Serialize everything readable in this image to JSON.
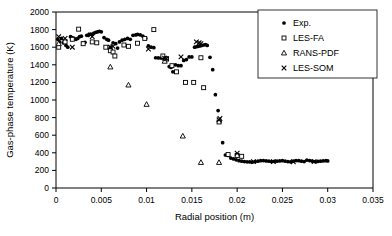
{
  "chart_data": {
    "type": "scatter",
    "title": "",
    "xlabel": "Radial position (m)",
    "ylabel": "Gas-phase temperature (K)",
    "xlim": [
      0,
      0.035
    ],
    "ylim": [
      0,
      2000
    ],
    "xticks": [
      0,
      0.005,
      0.01,
      0.015,
      0.02,
      0.025,
      0.03,
      0.035
    ],
    "xtick_labels": [
      "0",
      "0.005",
      "0.01",
      "0.015",
      "0.02",
      "0.025",
      "0.03",
      "0.035"
    ],
    "yticks": [
      0,
      200,
      400,
      600,
      800,
      1000,
      1200,
      1400,
      1600,
      1800,
      2000
    ],
    "ytick_labels": [
      "0",
      "200",
      "400",
      "600",
      "800",
      "1000",
      "1200",
      "1400",
      "1600",
      "1800",
      "2000"
    ],
    "grid": false,
    "legend_position": "top-right",
    "series": [
      {
        "name": "Exp.",
        "marker": "filled-circle",
        "color": "#000000",
        "points": [
          [
            0.0002,
            1690
          ],
          [
            0.0004,
            1660
          ],
          [
            0.0006,
            1700
          ],
          [
            0.0008,
            1650
          ],
          [
            0.0011,
            1620
          ],
          [
            0.0013,
            1600
          ],
          [
            0.0016,
            1720
          ],
          [
            0.0018,
            1710
          ],
          [
            0.002,
            1700
          ],
          [
            0.0022,
            1690
          ],
          [
            0.0024,
            1700
          ],
          [
            0.0026,
            1720
          ],
          [
            0.0028,
            1725
          ],
          [
            0.003,
            1650
          ],
          [
            0.0032,
            1655
          ],
          [
            0.0034,
            1735
          ],
          [
            0.0036,
            1740
          ],
          [
            0.0038,
            1750
          ],
          [
            0.004,
            1745
          ],
          [
            0.0042,
            1760
          ],
          [
            0.0044,
            1770
          ],
          [
            0.0046,
            1775
          ],
          [
            0.0048,
            1780
          ],
          [
            0.005,
            1775
          ],
          [
            0.0053,
            1710
          ],
          [
            0.0056,
            1690
          ],
          [
            0.0058,
            1680
          ],
          [
            0.006,
            1600
          ],
          [
            0.0063,
            1650
          ],
          [
            0.0066,
            1640
          ],
          [
            0.0068,
            1590
          ],
          [
            0.007,
            1660
          ],
          [
            0.0073,
            1680
          ],
          [
            0.0076,
            1690
          ],
          [
            0.0079,
            1700
          ],
          [
            0.0082,
            1690
          ],
          [
            0.0085,
            1735
          ],
          [
            0.0088,
            1740
          ],
          [
            0.009,
            1745
          ],
          [
            0.0093,
            1740
          ],
          [
            0.0096,
            1725
          ],
          [
            0.0099,
            1700
          ],
          [
            0.0102,
            1615
          ],
          [
            0.0105,
            1600
          ],
          [
            0.0108,
            1595
          ],
          [
            0.011,
            1480
          ],
          [
            0.0113,
            1478
          ],
          [
            0.0116,
            1476
          ],
          [
            0.0119,
            1475
          ],
          [
            0.0122,
            1480
          ],
          [
            0.0125,
            1380
          ],
          [
            0.0127,
            1370
          ],
          [
            0.0129,
            1320
          ],
          [
            0.0132,
            1400
          ],
          [
            0.0135,
            1390
          ],
          [
            0.0138,
            1390
          ],
          [
            0.0141,
            1450
          ],
          [
            0.0144,
            1460
          ],
          [
            0.0147,
            1490
          ],
          [
            0.015,
            1490
          ],
          [
            0.0153,
            1600
          ],
          [
            0.0155,
            1605
          ],
          [
            0.0157,
            1610
          ],
          [
            0.0159,
            1615
          ],
          [
            0.0161,
            1620
          ],
          [
            0.0163,
            1625
          ],
          [
            0.0165,
            1630
          ],
          [
            0.0167,
            1620
          ],
          [
            0.017,
            1485
          ],
          [
            0.0173,
            1345
          ],
          [
            0.0176,
            1060
          ],
          [
            0.0179,
            880
          ],
          [
            0.0181,
            750
          ],
          [
            0.0184,
            515
          ],
          [
            0.0187,
            375
          ],
          [
            0.019,
            370
          ],
          [
            0.0193,
            340
          ],
          [
            0.0196,
            330
          ],
          [
            0.0199,
            320
          ],
          [
            0.0202,
            310
          ],
          [
            0.0205,
            305
          ],
          [
            0.0208,
            300
          ],
          [
            0.0211,
            298
          ],
          [
            0.0214,
            296
          ],
          [
            0.0217,
            295
          ],
          [
            0.022,
            300
          ],
          [
            0.0223,
            305
          ],
          [
            0.0226,
            310
          ],
          [
            0.0229,
            312
          ],
          [
            0.0232,
            308
          ],
          [
            0.0235,
            305
          ],
          [
            0.0238,
            300
          ],
          [
            0.0241,
            302
          ],
          [
            0.0244,
            305
          ],
          [
            0.0247,
            308
          ],
          [
            0.025,
            310
          ],
          [
            0.0253,
            305
          ],
          [
            0.0256,
            300
          ],
          [
            0.0259,
            298
          ],
          [
            0.0262,
            305
          ],
          [
            0.0265,
            312
          ],
          [
            0.0268,
            310
          ],
          [
            0.0271,
            305
          ],
          [
            0.0274,
            300
          ],
          [
            0.0277,
            318
          ],
          [
            0.028,
            312
          ],
          [
            0.0283,
            305
          ],
          [
            0.0286,
            300
          ],
          [
            0.0289,
            302
          ],
          [
            0.0292,
            305
          ],
          [
            0.0295,
            308
          ],
          [
            0.0298,
            310
          ],
          [
            0.03,
            308
          ]
        ]
      },
      {
        "name": "LES-FA",
        "marker": "open-square",
        "color": "#000000",
        "points": [
          [
            0.0003,
            1600
          ],
          [
            0.001,
            1660
          ],
          [
            0.0018,
            1690
          ],
          [
            0.0025,
            1805
          ],
          [
            0.003,
            1640
          ],
          [
            0.004,
            1660
          ],
          [
            0.0045,
            1650
          ],
          [
            0.0055,
            1600
          ],
          [
            0.006,
            1560
          ],
          [
            0.0063,
            1545
          ],
          [
            0.0065,
            1500
          ],
          [
            0.0075,
            1625
          ],
          [
            0.008,
            1610
          ],
          [
            0.009,
            1645
          ],
          [
            0.0098,
            1700
          ],
          [
            0.0108,
            1800
          ],
          [
            0.0118,
            1500
          ],
          [
            0.0122,
            1465
          ],
          [
            0.0128,
            1390
          ],
          [
            0.0133,
            1320
          ],
          [
            0.0143,
            1200
          ],
          [
            0.0152,
            1200
          ],
          [
            0.016,
            1480
          ],
          [
            0.0163,
            1140
          ],
          [
            0.018,
            750
          ],
          [
            0.019,
            380
          ],
          [
            0.02,
            370
          ],
          [
            0.0205,
            360
          ]
        ]
      },
      {
        "name": "RANS-PDF",
        "marker": "open-triangle",
        "color": "#000000",
        "points": [
          [
            0.0003,
            1640
          ],
          [
            0.006,
            1375
          ],
          [
            0.008,
            1170
          ],
          [
            0.01,
            950
          ],
          [
            0.012,
            1440
          ],
          [
            0.014,
            590
          ],
          [
            0.016,
            290
          ],
          [
            0.018,
            290
          ]
        ]
      },
      {
        "name": "LES-SOM",
        "marker": "x-cross",
        "color": "#000000",
        "points": [
          [
            0.0003,
            1720
          ],
          [
            0.001,
            1700
          ],
          [
            0.0018,
            1600
          ],
          [
            0.0038,
            1740
          ],
          [
            0.004,
            1720
          ],
          [
            0.006,
            1600
          ],
          [
            0.0063,
            1610
          ],
          [
            0.0102,
            1580
          ],
          [
            0.012,
            1475
          ],
          [
            0.0122,
            1470
          ],
          [
            0.0138,
            1490
          ],
          [
            0.0155,
            1660
          ],
          [
            0.0158,
            1650
          ],
          [
            0.016,
            1640
          ],
          [
            0.018,
            775
          ],
          [
            0.0181,
            790
          ],
          [
            0.02,
            395
          ],
          [
            0.0218,
            300
          ],
          [
            0.024,
            300
          ],
          [
            0.0262,
            298
          ],
          [
            0.0285,
            300
          ]
        ]
      }
    ]
  },
  "legend": {
    "entries": [
      {
        "label": "Exp.",
        "marker": "filled-circle"
      },
      {
        "label": "LES-FA",
        "marker": "open-square"
      },
      {
        "label": "RANS-PDF",
        "marker": "open-triangle"
      },
      {
        "label": "LES-SOM",
        "marker": "x-cross"
      }
    ]
  }
}
